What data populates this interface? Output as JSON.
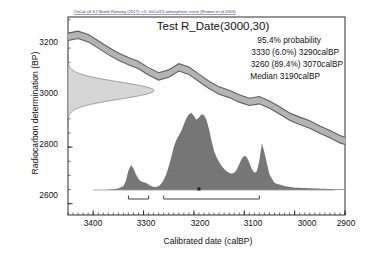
{
  "figure": {
    "credit": "OxCal v4.3.2 Bronk Ramsey (2017); r:5; IntCal13 atmospheric curve (Reimer et al 2013)",
    "title": "Test R_Date(3000,30)",
    "annotations": [
      "95.4% probability",
      "3330 (6.0%) 3290calBP",
      "3260 (89.4%) 3070calBP",
      "Median 3190calBP"
    ]
  },
  "colors": {
    "curve_band_fill": "#b4b4b4",
    "curve_band_stroke": "#5e5e5e",
    "likelihood_fill": "#d6d6d6",
    "likelihood_stroke": "#8a8a8a",
    "posterior_fill": "#767676",
    "axis": "#1a1a1a",
    "background": "#ffffff"
  },
  "chart_data": {
    "type": "area",
    "title": "Test R_Date(3000,30)",
    "xlabel": "Calibrated date (calBP)",
    "ylabel": "Radiocarbon determination (BP)",
    "xlim": [
      3450,
      2900
    ],
    "ylim": [
      2560,
      3260
    ],
    "x_reversed": true,
    "grid": false,
    "legend": null,
    "xticks": [
      3400,
      3300,
      3200,
      3100,
      3000,
      2900
    ],
    "yticks": [
      3200,
      3000,
      2800,
      2600
    ],
    "x_minor_tick_step": 10,
    "y_minor_tick_step": 50,
    "measurement": {
      "label": "R_Date",
      "radiocarbon_age_bp": 3000,
      "uncertainty_bp": 30
    },
    "median_calbp": 3190,
    "hpd_95_4": [
      {
        "from": 3330,
        "to": 3290,
        "probability_pct": 6.0
      },
      {
        "from": 3260,
        "to": 3070,
        "probability_pct": 89.4
      }
    ],
    "series": [
      {
        "name": "IntCal13 calibration curve (central)",
        "type": "line",
        "x": [
          3450,
          3430,
          3410,
          3390,
          3370,
          3350,
          3330,
          3310,
          3290,
          3270,
          3250,
          3230,
          3210,
          3190,
          3170,
          3150,
          3130,
          3110,
          3090,
          3070,
          3050,
          3030,
          3010,
          2990,
          2970,
          2950,
          2930,
          2910,
          2900
        ],
        "values": [
          3190,
          3197,
          3185,
          3163,
          3140,
          3120,
          3104,
          3090,
          3068,
          3050,
          3060,
          3082,
          3070,
          3045,
          3020,
          3000,
          2988,
          2972,
          2960,
          2966,
          2950,
          2930,
          2908,
          2893,
          2880,
          2862,
          2846,
          2828,
          2822
        ]
      },
      {
        "name": "IntCal13 calibration curve 1-sigma band",
        "type": "band",
        "x": [
          3450,
          3430,
          3410,
          3390,
          3370,
          3350,
          3330,
          3310,
          3290,
          3270,
          3250,
          3230,
          3210,
          3190,
          3170,
          3150,
          3130,
          3110,
          3090,
          3070,
          3050,
          3030,
          3010,
          2990,
          2970,
          2950,
          2930,
          2910,
          2900
        ],
        "upper": [
          3203,
          3210,
          3198,
          3176,
          3153,
          3133,
          3117,
          3103,
          3081,
          3063,
          3073,
          3095,
          3083,
          3058,
          3033,
          3013,
          3001,
          2985,
          2973,
          2979,
          2963,
          2943,
          2921,
          2906,
          2893,
          2875,
          2859,
          2841,
          2835
        ],
        "lower": [
          3177,
          3184,
          3172,
          3150,
          3127,
          3107,
          3091,
          3077,
          3055,
          3037,
          3047,
          3069,
          3057,
          3032,
          3007,
          2987,
          2975,
          2959,
          2947,
          2953,
          2937,
          2917,
          2895,
          2880,
          2867,
          2849,
          2833,
          2815,
          2809
        ]
      },
      {
        "name": "Radiocarbon likelihood (3000 +/- 30 BP)",
        "type": "gaussian",
        "mean_bp": 3000,
        "sigma_bp": 30
      },
      {
        "name": "Calibrated posterior probability density",
        "type": "density",
        "x": [
          3450,
          3420,
          3400,
          3380,
          3360,
          3350,
          3340,
          3335,
          3330,
          3325,
          3320,
          3315,
          3310,
          3305,
          3300,
          3295,
          3290,
          3285,
          3280,
          3275,
          3270,
          3265,
          3260,
          3255,
          3250,
          3245,
          3240,
          3235,
          3230,
          3225,
          3220,
          3215,
          3210,
          3205,
          3200,
          3195,
          3190,
          3185,
          3180,
          3175,
          3170,
          3165,
          3160,
          3155,
          3150,
          3145,
          3140,
          3135,
          3130,
          3125,
          3120,
          3115,
          3110,
          3105,
          3100,
          3095,
          3090,
          3085,
          3080,
          3075,
          3070,
          3065,
          3060,
          3050,
          3040,
          3020,
          3000,
          2960,
          2920,
          2900
        ],
        "values": [
          0.0,
          0.0,
          0.0,
          0.0,
          0.01,
          0.02,
          0.05,
          0.12,
          0.25,
          0.32,
          0.28,
          0.2,
          0.14,
          0.11,
          0.1,
          0.09,
          0.07,
          0.05,
          0.04,
          0.04,
          0.05,
          0.08,
          0.13,
          0.2,
          0.3,
          0.42,
          0.55,
          0.64,
          0.7,
          0.76,
          0.84,
          0.92,
          0.97,
          0.99,
          0.95,
          0.9,
          0.93,
          0.97,
          0.96,
          0.9,
          0.78,
          0.63,
          0.5,
          0.42,
          0.36,
          0.31,
          0.27,
          0.24,
          0.22,
          0.21,
          0.22,
          0.26,
          0.33,
          0.4,
          0.44,
          0.42,
          0.35,
          0.27,
          0.22,
          0.24,
          0.38,
          0.6,
          0.48,
          0.2,
          0.09,
          0.05,
          0.03,
          0.02,
          0.01,
          0.01
        ]
      }
    ]
  }
}
